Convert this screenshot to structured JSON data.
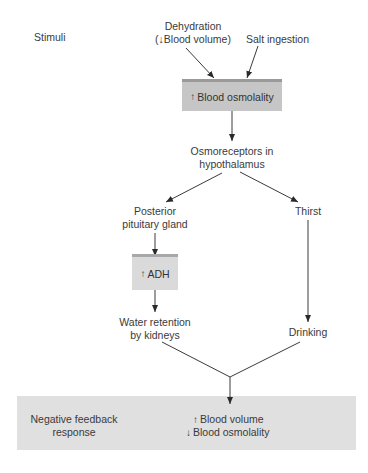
{
  "diagram": {
    "stimuli_label": "Stimuli",
    "stimuli": {
      "dehydration": {
        "line1": "Dehydration",
        "arrow": "↓",
        "line2": "Blood volume)",
        "open_paren": "("
      },
      "salt": "Salt ingestion"
    },
    "blood_osmolality_box": {
      "arrow": "↑",
      "text": "Blood osmolality"
    },
    "osmoreceptors": {
      "line1": "Osmoreceptors in",
      "line2": "hypothalamus"
    },
    "left_branch": {
      "pituitary": {
        "line1": "Posterior",
        "line2": "pituitary gland"
      },
      "adh_box": {
        "arrow": "↑",
        "text": "ADH"
      },
      "water_retention": {
        "line1": "Water retention",
        "line2": "by kidneys"
      }
    },
    "right_branch": {
      "thirst": "Thirst",
      "drinking": "Drinking"
    },
    "response_band": {
      "label_line1": "Negative feedback",
      "label_line2": "response",
      "result1_arrow": "↑",
      "result1": "Blood volume",
      "result2_arrow": "↓",
      "result2": "Blood osmolality"
    },
    "colors": {
      "box_fill": "#c6c6c6",
      "box_bevel": "#9a9a9a",
      "adh_fill": "#dadada",
      "band_fill": "#e0e0e0",
      "line": "#3a3a3a"
    }
  }
}
